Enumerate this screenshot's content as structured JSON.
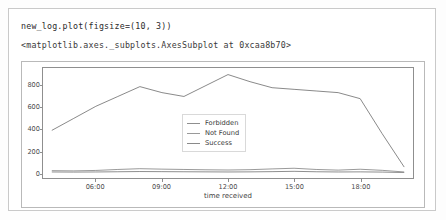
{
  "cell": {
    "code": "new_log.plot(figsize=(10, 3))",
    "output_repr": "<matplotlib.axes._subplots.AxesSubplot at 0xcaa8b70>"
  },
  "legend": {
    "position": "center",
    "entries": [
      {
        "label": "Forbidden",
        "color": "#8f8f8f"
      },
      {
        "label": "Not Found",
        "color": "#9a9a9a"
      },
      {
        "label": "Success",
        "color": "#8a8a8a"
      }
    ]
  },
  "chart_data": {
    "type": "line",
    "title": "",
    "xlabel": "time received",
    "ylabel": "",
    "grid": false,
    "legend_position": "center",
    "xlim": [
      3.6,
      20.4
    ],
    "ylim": [
      -45,
      960
    ],
    "yticks": [
      0,
      200,
      400,
      600,
      800
    ],
    "xticks": [
      6,
      9,
      12,
      15,
      18
    ],
    "xtick_labels": [
      "06:00",
      "09:00",
      "12:00",
      "15:00",
      "18:00"
    ],
    "x": [
      4,
      5,
      6,
      7,
      8,
      9,
      10,
      11,
      12,
      13,
      14,
      15,
      16,
      17,
      18,
      19,
      20
    ],
    "series": [
      {
        "name": "Forbidden",
        "color": "#8f8f8f",
        "values": [
          10,
          9,
          10,
          12,
          14,
          13,
          12,
          11,
          10,
          11,
          13,
          16,
          12,
          10,
          11,
          9,
          5
        ]
      },
      {
        "name": "Not Found",
        "color": "#9a9a9a",
        "values": [
          22,
          20,
          24,
          33,
          40,
          36,
          33,
          30,
          28,
          31,
          38,
          44,
          33,
          27,
          35,
          25,
          10
        ]
      },
      {
        "name": "Success",
        "color": "#8a8a8a",
        "values": [
          390,
          500,
          610,
          700,
          790,
          735,
          700,
          800,
          900,
          835,
          780,
          765,
          750,
          735,
          680,
          360,
          55
        ]
      }
    ]
  }
}
